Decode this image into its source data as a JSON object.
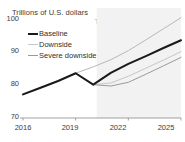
{
  "chart_data": {
    "type": "line",
    "title": "Trillions of U.S. dollars",
    "xlabel": "",
    "ylabel": "Trillions of U.S. dollars",
    "xlim": [
      2016,
      2025
    ],
    "ylim": [
      70,
      100
    ],
    "yticks": [
      70,
      80,
      90,
      100
    ],
    "xticks": [
      2016,
      2019,
      2022,
      2025
    ],
    "grid": false,
    "legend_position": "upper-left",
    "annotations": [
      {
        "text_line1": "Trend based on",
        "text_line2": "2010-19",
        "x": 2021.6,
        "y": 97.5,
        "color": "#9d9d9d"
      }
    ],
    "shaded_region": {
      "label": "forecast",
      "x_start": 2020.2,
      "x_end": 2025,
      "color": "#f2f2f2"
    },
    "x": [
      2016,
      2017,
      2018,
      2019,
      2020,
      2021,
      2022,
      2023,
      2024,
      2025
    ],
    "series": [
      {
        "name": "Baseline",
        "color": "#1a1a1a",
        "width": 2.0,
        "values": [
          77.0,
          79.0,
          81.0,
          83.3,
          79.9,
          83.4,
          86.1,
          88.4,
          90.8,
          93.1
        ]
      },
      {
        "name": "Downside",
        "color": "#c7c7c7",
        "width": 1.0,
        "values": [
          77.0,
          79.0,
          81.0,
          83.3,
          79.9,
          80.4,
          82.4,
          84.8,
          87.2,
          89.7
        ]
      },
      {
        "name": "Severe downside",
        "color": "#9a9a9a",
        "width": 1.0,
        "values": [
          77.0,
          79.0,
          81.0,
          83.3,
          79.9,
          79.5,
          80.6,
          83.0,
          85.5,
          88.0
        ]
      },
      {
        "name": "Trend based on 2010-19",
        "color": "#b8b8b8",
        "width": 1.0,
        "legend_hidden": true,
        "values": [
          77.0,
          79.0,
          81.0,
          83.3,
          85.2,
          87.3,
          90.0,
          93.2,
          96.5,
          99.8
        ]
      }
    ]
  },
  "axis": {
    "title": "Trillions of U.S. dollars",
    "y_labels": [
      "100",
      "90",
      "80",
      "70"
    ],
    "x_labels": [
      "2016",
      "2019",
      "2022",
      "2025"
    ]
  },
  "legend": {
    "items": [
      {
        "label": "Baseline"
      },
      {
        "label": "Downside"
      },
      {
        "label": "Severe downside"
      }
    ]
  },
  "annotation": {
    "line1": "Trend based on",
    "line2": "2010-19"
  }
}
